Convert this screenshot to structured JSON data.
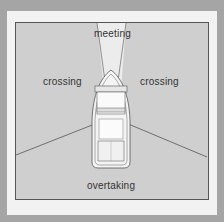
{
  "diagram": {
    "sectors": [
      {
        "id": "meeting",
        "label": "meeting"
      },
      {
        "id": "crossing_left",
        "label": "crossing"
      },
      {
        "id": "crossing_right",
        "label": "crossing"
      },
      {
        "id": "overtaking",
        "label": "overtaking"
      }
    ],
    "colors": {
      "frame": "#a5a5a5",
      "mat": "#f2f2f2",
      "sector_fill": "#cfcfcf",
      "meeting_fill": "#ececec",
      "line": "#555555"
    }
  }
}
